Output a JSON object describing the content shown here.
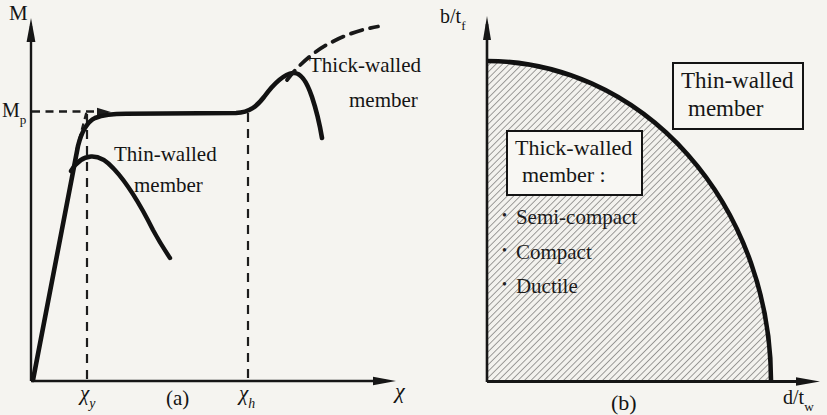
{
  "figure": {
    "panel_a": {
      "caption": "(a)",
      "y_axis_label": "M",
      "x_axis_label": "χ",
      "yield_moment_label": {
        "main": "M",
        "sub": "p"
      },
      "tick_chi_y": {
        "main": "χ",
        "sub": "y"
      },
      "tick_chi_h": {
        "main": "χ",
        "sub": "h"
      },
      "thick_label_line1": "Thick-walled",
      "thick_label_line2": "member",
      "thin_label_line1": "Thin-walled",
      "thin_label_line2": "member"
    },
    "panel_b": {
      "caption": "(b)",
      "y_axis_label": {
        "main": "b/t",
        "sub": "f"
      },
      "x_axis_label": {
        "main": "d/t",
        "sub": "w"
      },
      "thin_box": {
        "line1": "Thin-walled",
        "line2": "member"
      },
      "thick_box": {
        "line1": "Thick-walled",
        "line2": "member :"
      },
      "bullets": [
        {
          "marker": "•",
          "label": "Semi-compact"
        },
        {
          "marker": "•",
          "label": "Compact"
        },
        {
          "marker": "•",
          "label": "Ductile"
        }
      ]
    },
    "colors": {
      "ink": "#161616",
      "background": "#f5f4f0",
      "hatch_line": "#4d4d4d"
    }
  }
}
